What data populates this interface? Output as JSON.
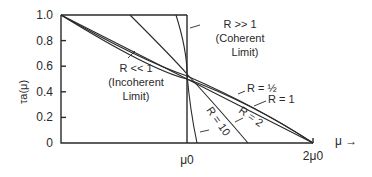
{
  "figure": {
    "y_axis_label": "τa(μ)",
    "y_ticks": [
      "1.0",
      "0.8",
      "0.6",
      "0.4",
      "0.2",
      "0"
    ],
    "x_ticks": [
      "μ0",
      "2μ0"
    ],
    "x_axis_label": "μ →"
  },
  "annotations": {
    "coherent": {
      "line1": "R >> 1",
      "line2": "(Coherent",
      "line3": "Limit)"
    },
    "incoherent": {
      "line1": "R << 1",
      "line2": "(Incoherent",
      "line3": "Limit)"
    },
    "r_half": "R = ½",
    "r_one": "R = 1",
    "r_two": "R = 2",
    "r_ten": "R = 10"
  },
  "curves": [
    {
      "name": "R<<1 (incoherent limit)",
      "description": "straight line from (0,1) to (2μ0,0)"
    },
    {
      "name": "R=1/2",
      "description": "near-linear from (0,1) to (2μ0,0)"
    },
    {
      "name": "R=1",
      "description": "near-linear from (0,1) to (2μ0,0)"
    },
    {
      "name": "R=2",
      "description": "steeper to ~1.5μ0 then along axis"
    },
    {
      "name": "R=10",
      "description": "steep curve crossing near μ0"
    },
    {
      "name": "R>>1 (coherent limit)",
      "description": "step: 1 until μ0, then 0"
    }
  ]
}
